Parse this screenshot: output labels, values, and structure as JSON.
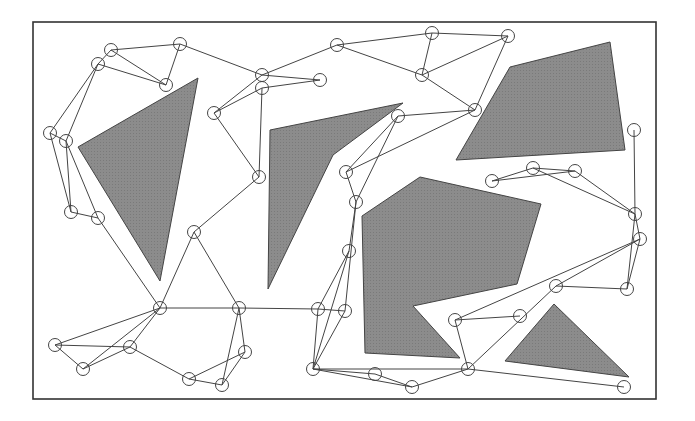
{
  "diagram": {
    "type": "probabilistic-roadmap",
    "frame": {
      "x": 33,
      "y": 22,
      "width": 623,
      "height": 377,
      "stroke": "#333333"
    },
    "colors": {
      "obstacle_fill": "#8c8c8c",
      "obstacle_stroke": "#444444",
      "edge": "#444444",
      "node_stroke": "#444444",
      "background": "#ffffff"
    },
    "node_radius": 6.5,
    "obstacles": [
      {
        "id": "obstacle-left-triangle",
        "points": [
          [
            78,
            147
          ],
          [
            198,
            78
          ],
          [
            160,
            281
          ]
        ]
      },
      {
        "id": "obstacle-center-left",
        "points": [
          [
            270,
            130
          ],
          [
            403,
            103
          ],
          [
            333,
            155
          ],
          [
            268,
            289
          ]
        ]
      },
      {
        "id": "obstacle-top-right",
        "points": [
          [
            456,
            160
          ],
          [
            510,
            67
          ],
          [
            610,
            42
          ],
          [
            625,
            150
          ]
        ]
      },
      {
        "id": "obstacle-center",
        "points": [
          [
            362,
            216
          ],
          [
            420,
            177
          ],
          [
            541,
            204
          ],
          [
            517,
            284
          ],
          [
            413,
            306
          ],
          [
            460,
            358
          ],
          [
            365,
            353
          ]
        ]
      },
      {
        "id": "obstacle-bottom-right-triangle",
        "points": [
          [
            505,
            361
          ],
          [
            554,
            304
          ],
          [
            629,
            377
          ]
        ]
      }
    ],
    "nodes": [
      {
        "id": "A",
        "x": 111,
        "y": 50
      },
      {
        "id": "B",
        "x": 180,
        "y": 44
      },
      {
        "id": "C",
        "x": 98,
        "y": 64
      },
      {
        "id": "D",
        "x": 166,
        "y": 85
      },
      {
        "id": "E",
        "x": 50,
        "y": 133
      },
      {
        "id": "F",
        "x": 66,
        "y": 141
      },
      {
        "id": "G",
        "x": 71,
        "y": 212
      },
      {
        "id": "H",
        "x": 98,
        "y": 218
      },
      {
        "id": "I",
        "x": 262,
        "y": 75
      },
      {
        "id": "J",
        "x": 262,
        "y": 88
      },
      {
        "id": "K",
        "x": 320,
        "y": 80
      },
      {
        "id": "L",
        "x": 214,
        "y": 113
      },
      {
        "id": "M",
        "x": 259,
        "y": 177
      },
      {
        "id": "N",
        "x": 194,
        "y": 232
      },
      {
        "id": "O",
        "x": 337,
        "y": 45
      },
      {
        "id": "P",
        "x": 432,
        "y": 33
      },
      {
        "id": "Q",
        "x": 508,
        "y": 36
      },
      {
        "id": "R",
        "x": 422,
        "y": 75
      },
      {
        "id": "S",
        "x": 475,
        "y": 110
      },
      {
        "id": "T",
        "x": 398,
        "y": 116
      },
      {
        "id": "U",
        "x": 346,
        "y": 172
      },
      {
        "id": "V",
        "x": 356,
        "y": 202
      },
      {
        "id": "W",
        "x": 349,
        "y": 251
      },
      {
        "id": "X",
        "x": 634,
        "y": 130
      },
      {
        "id": "Y",
        "x": 492,
        "y": 181
      },
      {
        "id": "Z",
        "x": 533,
        "y": 168
      },
      {
        "id": "AA",
        "x": 575,
        "y": 171
      },
      {
        "id": "AB",
        "x": 635,
        "y": 214
      },
      {
        "id": "AC",
        "x": 640,
        "y": 239
      },
      {
        "id": "AD",
        "x": 627,
        "y": 289
      },
      {
        "id": "AE",
        "x": 556,
        "y": 286
      },
      {
        "id": "AF",
        "x": 520,
        "y": 316
      },
      {
        "id": "AG",
        "x": 455,
        "y": 320
      },
      {
        "id": "AH",
        "x": 468,
        "y": 369
      },
      {
        "id": "AI",
        "x": 624,
        "y": 387
      },
      {
        "id": "AJ",
        "x": 160,
        "y": 308
      },
      {
        "id": "AK",
        "x": 239,
        "y": 308
      },
      {
        "id": "AL",
        "x": 318,
        "y": 309
      },
      {
        "id": "AM",
        "x": 345,
        "y": 311
      },
      {
        "id": "AN",
        "x": 313,
        "y": 369
      },
      {
        "id": "AO",
        "x": 375,
        "y": 374
      },
      {
        "id": "AP",
        "x": 412,
        "y": 387
      },
      {
        "id": "AQ",
        "x": 55,
        "y": 345
      },
      {
        "id": "AR",
        "x": 83,
        "y": 369
      },
      {
        "id": "AS",
        "x": 130,
        "y": 347
      },
      {
        "id": "AT",
        "x": 189,
        "y": 379
      },
      {
        "id": "AU",
        "x": 222,
        "y": 385
      },
      {
        "id": "AV",
        "x": 245,
        "y": 352
      }
    ],
    "edges": [
      [
        "A",
        "B"
      ],
      [
        "A",
        "D"
      ],
      [
        "C",
        "D"
      ],
      [
        "B",
        "D"
      ],
      [
        "A",
        "C"
      ],
      [
        "C",
        "E"
      ],
      [
        "C",
        "F"
      ],
      [
        "B",
        "I"
      ],
      [
        "E",
        "F"
      ],
      [
        "E",
        "G"
      ],
      [
        "F",
        "G"
      ],
      [
        "F",
        "H"
      ],
      [
        "G",
        "H"
      ],
      [
        "H",
        "AJ"
      ],
      [
        "I",
        "O"
      ],
      [
        "I",
        "K"
      ],
      [
        "J",
        "K"
      ],
      [
        "I",
        "L"
      ],
      [
        "J",
        "L"
      ],
      [
        "L",
        "M"
      ],
      [
        "J",
        "M"
      ],
      [
        "M",
        "N"
      ],
      [
        "N",
        "AJ"
      ],
      [
        "N",
        "AK"
      ],
      [
        "O",
        "P"
      ],
      [
        "O",
        "R"
      ],
      [
        "P",
        "Q"
      ],
      [
        "P",
        "R"
      ],
      [
        "R",
        "Q"
      ],
      [
        "R",
        "S"
      ],
      [
        "Q",
        "S"
      ],
      [
        "T",
        "S"
      ],
      [
        "U",
        "S"
      ],
      [
        "U",
        "T"
      ],
      [
        "V",
        "T"
      ],
      [
        "U",
        "V"
      ],
      [
        "V",
        "W"
      ],
      [
        "W",
        "AL"
      ],
      [
        "W",
        "AN"
      ],
      [
        "V",
        "AM"
      ],
      [
        "AM",
        "AN"
      ],
      [
        "AL",
        "AN"
      ],
      [
        "AL",
        "AM"
      ],
      [
        "AJ",
        "AK"
      ],
      [
        "AK",
        "AL"
      ],
      [
        "AK",
        "AV"
      ],
      [
        "AK",
        "AU"
      ],
      [
        "AJ",
        "AQ"
      ],
      [
        "AJ",
        "AR"
      ],
      [
        "AJ",
        "AS"
      ],
      [
        "AQ",
        "AR"
      ],
      [
        "AQ",
        "AS"
      ],
      [
        "AR",
        "AS"
      ],
      [
        "AS",
        "AT"
      ],
      [
        "AT",
        "AU"
      ],
      [
        "AT",
        "AV"
      ],
      [
        "AU",
        "AV"
      ],
      [
        "AN",
        "AO"
      ],
      [
        "AN",
        "AP"
      ],
      [
        "AO",
        "AP"
      ],
      [
        "AN",
        "AH"
      ],
      [
        "AP",
        "AH"
      ],
      [
        "AH",
        "AG"
      ],
      [
        "AH",
        "AE"
      ],
      [
        "AH",
        "AI"
      ],
      [
        "AG",
        "AF"
      ],
      [
        "AG",
        "AC"
      ],
      [
        "AE",
        "AD"
      ],
      [
        "AE",
        "AC"
      ],
      [
        "Y",
        "Z"
      ],
      [
        "Y",
        "AA"
      ],
      [
        "Z",
        "AA"
      ],
      [
        "Z",
        "AB"
      ],
      [
        "AA",
        "AB"
      ],
      [
        "X",
        "AB"
      ],
      [
        "AB",
        "AC"
      ],
      [
        "AB",
        "AD"
      ],
      [
        "AC",
        "AD"
      ]
    ]
  }
}
